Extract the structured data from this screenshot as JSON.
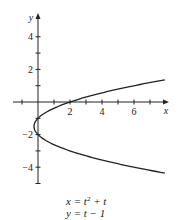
{
  "chart_data": {
    "type": "line",
    "title": "",
    "xlabel": "x",
    "ylabel": "y",
    "xlim": [
      -1.6,
      8.1
    ],
    "ylim": [
      -5.2,
      5.4
    ],
    "x_ticks": [
      -1,
      1,
      2,
      3,
      4,
      5,
      6,
      7
    ],
    "x_tick_labels": {
      "2": "2",
      "4": "4",
      "6": "6"
    },
    "y_ticks": [
      -5,
      -4,
      -3,
      -2,
      -1,
      1,
      2,
      3,
      4
    ],
    "y_tick_labels": {
      "4": "4",
      "2": "2",
      "-2": "-2",
      "-4": "-4"
    },
    "grid": false,
    "legend": null,
    "series": [
      {
        "name": "parametric curve",
        "parametric": {
          "x": "t^2 + t",
          "y": "t - 1",
          "t_range": [
            -3.36,
            2.36
          ]
        },
        "points": [
          [
            7.93,
            -4.36
          ],
          [
            6.0,
            -4.0
          ],
          [
            3.75,
            -3.5
          ],
          [
            2.0,
            -3.0
          ],
          [
            0.75,
            -2.5
          ],
          [
            0.0,
            -2.0
          ],
          [
            -0.25,
            -1.5
          ],
          [
            0.0,
            -1.0
          ],
          [
            0.75,
            -0.5
          ],
          [
            2.0,
            0.0
          ],
          [
            3.75,
            0.5
          ],
          [
            6.0,
            1.0
          ],
          [
            7.93,
            1.36
          ]
        ]
      }
    ],
    "annotations": [
      "x = t^2 + t",
      "y = t - 1"
    ]
  },
  "equations": {
    "line1_prefix": "x = t",
    "line1_exp": "2",
    "line1_suffix": " + t",
    "line2": "y = t − 1"
  },
  "colors": {
    "axis": "#222222",
    "curve": "#222222",
    "text": "#222222"
  }
}
